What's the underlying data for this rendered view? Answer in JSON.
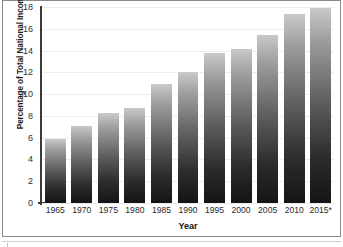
{
  "chart_data": {
    "type": "bar",
    "title": "",
    "xlabel": "Year",
    "ylabel": "Percentage of Total National Income",
    "categories": [
      "1965",
      "1970",
      "1975",
      "1980",
      "1985",
      "1990",
      "1995",
      "2000",
      "2005",
      "2010",
      "2015*"
    ],
    "values": [
      5.9,
      7.1,
      8.3,
      8.7,
      10.9,
      12.0,
      13.8,
      14.1,
      15.4,
      17.4,
      17.9
    ],
    "ylim": [
      0,
      18
    ],
    "yticks": [
      "0",
      "2",
      "4",
      "6",
      "8",
      "10",
      "12",
      "14",
      "16",
      "18"
    ],
    "ytick_values": [
      0,
      2,
      4,
      6,
      8,
      10,
      12,
      14,
      16,
      18
    ],
    "grid": true,
    "legend": "none",
    "bar_gradient_top": "#c9c9c9",
    "bar_gradient_bottom": "#141414",
    "gridline_color": "#ededed",
    "axis_color": "#3a3a3a",
    "frame_color": "#888888"
  }
}
